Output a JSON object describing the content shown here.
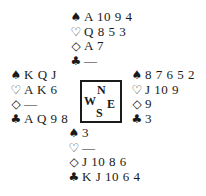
{
  "suit_symbols": {
    "spades": "♠",
    "hearts": "♡",
    "diamonds": "◇",
    "clubs": "♣"
  },
  "compass": {
    "north": "N",
    "west": "W",
    "east": "E",
    "south": "S"
  },
  "hands": {
    "north": {
      "spades": "A 10 9 4",
      "hearts": "Q 8 5 3",
      "diamonds": "A 7",
      "clubs": "—"
    },
    "west": {
      "spades": "K Q J",
      "hearts": "A K 6",
      "diamonds": "—",
      "clubs": "A Q 9 8"
    },
    "east": {
      "spades": "8 7 6 5 2",
      "hearts": "J 10 9",
      "diamonds": "9",
      "clubs": "3"
    },
    "south": {
      "spades": "3",
      "hearts": "—",
      "diamonds": "J 10 8 6",
      "clubs": "K J 10 6 4"
    }
  }
}
